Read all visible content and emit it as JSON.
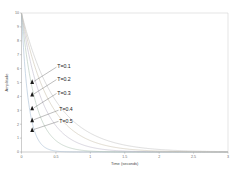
{
  "chart_data": {
    "type": "line",
    "title": "",
    "xlabel": "Time (seconds)",
    "ylabel": "Amplitude",
    "xlim": [
      0,
      3
    ],
    "ylim": [
      0,
      10
    ],
    "xticks": [
      "0",
      "0.5",
      "1",
      "1.5",
      "2",
      "2.5",
      "3"
    ],
    "xtick_values": [
      0,
      0.5,
      1,
      1.5,
      2,
      2.5,
      3
    ],
    "yticks": [
      "0",
      "1",
      "2",
      "3",
      "4",
      "5",
      "6",
      "7",
      "8",
      "9",
      "10"
    ],
    "ytick_values": [
      0,
      1,
      2,
      3,
      4,
      5,
      6,
      7,
      8,
      9,
      10
    ],
    "grid": false,
    "legend_position": "inline-annotations",
    "series": [
      {
        "name": "T=0.1",
        "label": "T=0.1",
        "time_constant": 0.1,
        "amplitude": 10,
        "color": "#9fb8cf",
        "marker_x": 0.155,
        "marker_y": 5.0,
        "label_x": 0.52,
        "label_y": 6.15
      },
      {
        "name": "T=0.2",
        "label": "T=0.2",
        "time_constant": 0.2,
        "amplitude": 10,
        "color": "#a8bfae",
        "marker_x": 0.155,
        "marker_y": 4.1,
        "label_x": 0.52,
        "label_y": 5.25
      },
      {
        "name": "T=0.3",
        "label": "T=0.3",
        "time_constant": 0.3,
        "amplitude": 10,
        "color": "#b9b3c7",
        "marker_x": 0.155,
        "marker_y": 3.1,
        "label_x": 0.52,
        "label_y": 4.25
      },
      {
        "name": "T=0.4",
        "label": "T=0.4",
        "time_constant": 0.4,
        "amplitude": 10,
        "color": "#c7bda8",
        "marker_x": 0.155,
        "marker_y": 2.25,
        "label_x": 0.55,
        "label_y": 3.05
      },
      {
        "name": "T=0.5",
        "label": "T=0.5",
        "time_constant": 0.5,
        "amplitude": 10,
        "color": "#bfbfbf",
        "marker_x": 0.155,
        "marker_y": 1.55,
        "label_x": 0.55,
        "label_y": 2.25
      }
    ]
  }
}
